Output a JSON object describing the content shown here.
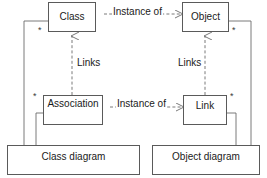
{
  "diagram": {
    "colors": {
      "background": "#ffffff",
      "box_border": "#5a5a5a",
      "line": "#6b6b6b",
      "text": "#1a1a1a"
    },
    "nodes": [
      {
        "id": "class",
        "label": "Class",
        "x": 48,
        "y": 2,
        "w": 48,
        "h": 30
      },
      {
        "id": "object",
        "label": "Object",
        "x": 182,
        "y": 2,
        "w": 47,
        "h": 30
      },
      {
        "id": "association",
        "label": "Association",
        "x": 43,
        "y": 95,
        "w": 60,
        "h": 30
      },
      {
        "id": "link",
        "label": "Link",
        "x": 183,
        "y": 95,
        "w": 44,
        "h": 30
      },
      {
        "id": "class-diagram",
        "label": "Class diagram",
        "x": 7,
        "y": 145,
        "w": 133,
        "h": 30
      },
      {
        "id": "object-diagram",
        "label": "Object diagram",
        "x": 152,
        "y": 145,
        "w": 108,
        "h": 30
      }
    ],
    "edge_labels": [
      {
        "id": "instance-of-top",
        "text": "Instance of",
        "x": 112,
        "y": 7,
        "from": "object",
        "to": "class",
        "style": "dashed-arrow"
      },
      {
        "id": "instance-of-bottom",
        "text": "Instance of",
        "x": 116,
        "y": 99,
        "from": "link",
        "to": "association",
        "style": "dashed-arrow"
      },
      {
        "id": "links-left",
        "text": "Links",
        "x": 76,
        "y": 58,
        "from": "association",
        "to": "class",
        "style": "dashed-arrow"
      },
      {
        "id": "links-right",
        "text": "Links",
        "x": 177,
        "y": 58,
        "from": "link",
        "to": "object",
        "style": "dashed-arrow"
      }
    ],
    "multiplicities": [
      {
        "id": "mult-class",
        "text": "*",
        "x": 38,
        "y": 26
      },
      {
        "id": "mult-object",
        "text": "*",
        "x": 232,
        "y": 26
      },
      {
        "id": "mult-association",
        "text": "*",
        "x": 33,
        "y": 92
      },
      {
        "id": "mult-link",
        "text": "*",
        "x": 230,
        "y": 92
      }
    ]
  }
}
